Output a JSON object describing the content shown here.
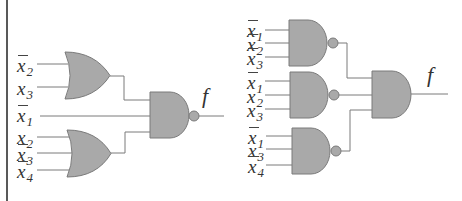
{
  "diagram": {
    "type": "logic-circuit",
    "colors": {
      "gate_fill": "#a9a9a9",
      "wire": "#7a7a7a",
      "text": "#333333",
      "border": "#222222"
    },
    "left_circuit": {
      "output_label": "f",
      "gates": [
        {
          "id": "or1",
          "type": "OR",
          "inputs": [
            "x̄2",
            "x3"
          ]
        },
        {
          "id": "or2",
          "type": "OR",
          "inputs": [
            "x2",
            "x̄3",
            "x̄4"
          ]
        },
        {
          "id": "nand_out",
          "type": "NAND",
          "inputs": [
            "or1",
            "x̄1",
            "or2"
          ]
        }
      ],
      "input_labels": [
        {
          "var": "x",
          "sub": "2",
          "negated": true
        },
        {
          "var": "x",
          "sub": "3",
          "negated": false
        },
        {
          "var": "x",
          "sub": "1",
          "negated": true
        },
        {
          "var": "x",
          "sub": "2",
          "negated": false
        },
        {
          "var": "x",
          "sub": "3",
          "negated": true
        },
        {
          "var": "x",
          "sub": "4",
          "negated": true
        }
      ]
    },
    "right_circuit": {
      "output_label": "f",
      "gates": [
        {
          "id": "nand1",
          "type": "NAND",
          "inputs": [
            "x̄1",
            "x̄2",
            "x̄3"
          ]
        },
        {
          "id": "nand2",
          "type": "NAND",
          "inputs": [
            "x̄1",
            "x2",
            "x3"
          ]
        },
        {
          "id": "nand3",
          "type": "NAND",
          "inputs": [
            "x̄1",
            "x3",
            "x̄4"
          ]
        },
        {
          "id": "and_out",
          "type": "AND",
          "inputs": [
            "nand1",
            "nand2",
            "nand3"
          ]
        }
      ],
      "input_labels": [
        {
          "var": "x",
          "sub": "1",
          "negated": true
        },
        {
          "var": "x",
          "sub": "2",
          "negated": true
        },
        {
          "var": "x",
          "sub": "3",
          "negated": true
        },
        {
          "var": "x",
          "sub": "1",
          "negated": true
        },
        {
          "var": "x",
          "sub": "2",
          "negated": false
        },
        {
          "var": "x",
          "sub": "3",
          "negated": false
        },
        {
          "var": "x",
          "sub": "1",
          "negated": true
        },
        {
          "var": "x",
          "sub": "3",
          "negated": false
        },
        {
          "var": "x",
          "sub": "4",
          "negated": true
        }
      ]
    }
  }
}
